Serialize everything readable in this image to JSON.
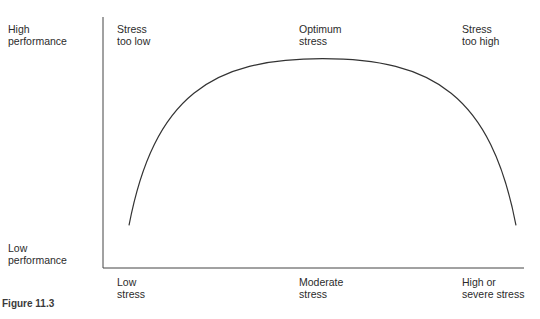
{
  "diagram": {
    "type": "inverted-u-curve",
    "y_axis": {
      "top_label": "High\nperformance",
      "bottom_label": "Low\nperformance"
    },
    "x_axis": {
      "labels": [
        "Low\nstress",
        "Moderate\nstress",
        "High or\nsevere stress"
      ]
    },
    "zone_labels": [
      "Stress\ntoo low",
      "Optimum\nstress",
      "Stress\ntoo high"
    ],
    "curve": {
      "description": "Performance rises with stress to an optimum at moderate stress, then falls",
      "points": [
        {
          "stress": 0.0,
          "performance": 0.1
        },
        {
          "stress": 0.5,
          "performance": 0.9
        },
        {
          "stress": 1.0,
          "performance": 0.1
        }
      ]
    },
    "line_color": "#333333"
  },
  "caption": "Figure 11.3"
}
